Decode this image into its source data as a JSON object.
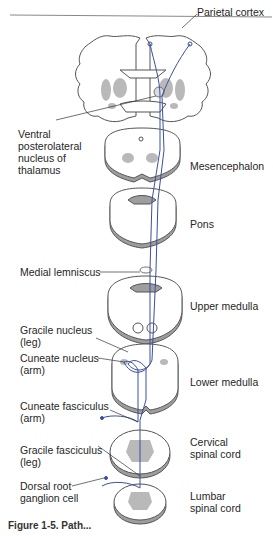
{
  "figure": {
    "type": "anatomical pathway diagram",
    "pathway_color": "#3a4fa0",
    "gray_matter_color": "#b9b9b9",
    "caption_partial": "Figure 1-5. Path..."
  },
  "labels": {
    "parietal_cortex": "Parietal cortex",
    "vpl": [
      "Ventral",
      "posterolateral",
      "nucleus of",
      "thalamus"
    ],
    "mesencephalon": "Mesencephalon",
    "pons": "Pons",
    "medial_lemniscus": "Medial lemniscus",
    "upper_medulla": "Upper medulla",
    "gracile_nucleus": [
      "Gracile nucleus",
      "(leg)"
    ],
    "cuneate_nucleus": [
      "Cuneate nucleus",
      "(arm)"
    ],
    "lower_medulla": "Lower medulla",
    "cuneate_fasciculus": [
      "Cuneate fasciculus",
      "(arm)"
    ],
    "cervical": [
      "Cervical",
      "spinal cord"
    ],
    "gracile_fasciculus": [
      "Gracile fasciculus",
      "(leg)"
    ],
    "drg": [
      "Dorsal root",
      "ganglion cell"
    ],
    "lumbar": [
      "Lumbar",
      "spinal cord"
    ]
  }
}
